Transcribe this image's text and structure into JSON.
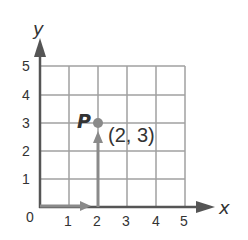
{
  "axes": {
    "x_label": "x",
    "y_label": "y",
    "origin_label": "0",
    "x_ticks": [
      "1",
      "2",
      "3",
      "4",
      "5"
    ],
    "y_ticks": [
      "1",
      "2",
      "3",
      "4",
      "5"
    ]
  },
  "point": {
    "name": "P",
    "coords_label": "(2, 3)",
    "x": 2,
    "y": 3
  },
  "colors": {
    "grid": "#a0a0a0",
    "axis": "#555555",
    "path_arrow": "#8a8a8a",
    "point": "#8a8a8a",
    "text": "#333333"
  }
}
